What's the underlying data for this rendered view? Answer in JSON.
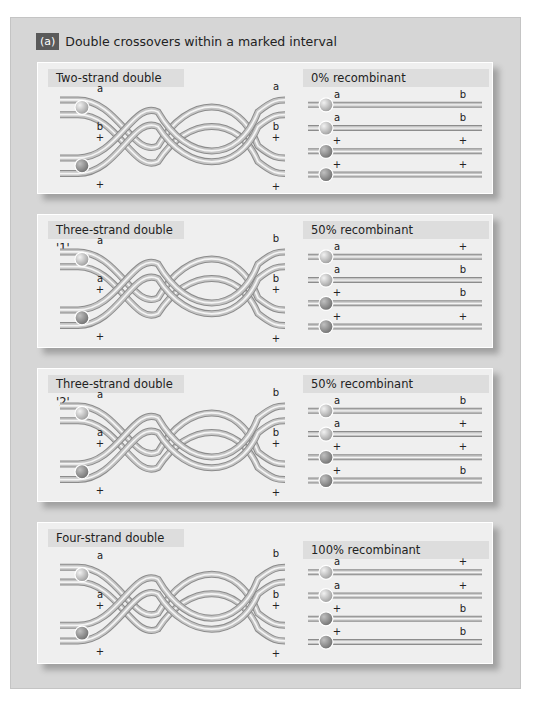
{
  "heading": {
    "badge": "(a)",
    "title": "Double crossovers within a marked interval"
  },
  "panels": [
    {
      "title": "Two-strand double",
      "result": "0% recombinant",
      "left_labels": {
        "top_left": "a",
        "top_right": "a",
        "mid_left_1": "b",
        "mid_left_2": "+",
        "mid_right_1": "b",
        "mid_right_2": "+",
        "bottom_left": "+",
        "bottom_right": "+"
      },
      "products": [
        {
          "left": "a",
          "right": "b"
        },
        {
          "left": "a",
          "right": "b"
        },
        {
          "left": "+",
          "right": "+"
        },
        {
          "left": "+",
          "right": "+"
        }
      ]
    },
    {
      "title": "Three-strand double '1'",
      "result": "50% recombinant",
      "left_labels": {
        "top_left": "a",
        "top_right": "b",
        "mid_left_1": "a",
        "mid_left_2": "+",
        "mid_right_1": "b",
        "mid_right_2": "+",
        "bottom_left": "+",
        "bottom_right": "+"
      },
      "products": [
        {
          "left": "a",
          "right": "+"
        },
        {
          "left": "a",
          "right": "b"
        },
        {
          "left": "+",
          "right": "b"
        },
        {
          "left": "+",
          "right": "+"
        }
      ]
    },
    {
      "title": "Three-strand double '2'",
      "result": "50% recombinant",
      "left_labels": {
        "top_left": "a",
        "top_right": "b",
        "mid_left_1": "a",
        "mid_left_2": "+",
        "mid_right_1": "b",
        "mid_right_2": "+",
        "bottom_left": "+",
        "bottom_right": "+"
      },
      "products": [
        {
          "left": "a",
          "right": "b"
        },
        {
          "left": "a",
          "right": "+"
        },
        {
          "left": "+",
          "right": "+"
        },
        {
          "left": "+",
          "right": "b"
        }
      ]
    },
    {
      "title": "Four-strand double",
      "result": "100% recombinant",
      "left_labels": {
        "top_left": "a",
        "top_right": "b",
        "mid_left_1": "a",
        "mid_left_2": "+",
        "mid_right_1": "b",
        "mid_right_2": "+",
        "bottom_left": "+",
        "bottom_right": "+"
      },
      "products": [
        {
          "left": "a",
          "right": "+"
        },
        {
          "left": "a",
          "right": "+"
        },
        {
          "left": "+",
          "right": "b"
        },
        {
          "left": "+",
          "right": "b"
        }
      ]
    }
  ],
  "colors": {
    "frame": "#d6d6d6",
    "panel": "#efefef",
    "badge": "#5a5a5a",
    "strand": "#bdbdbd",
    "centromere_light": "#c8c8c8",
    "centromere_dark": "#8a8a8a"
  }
}
